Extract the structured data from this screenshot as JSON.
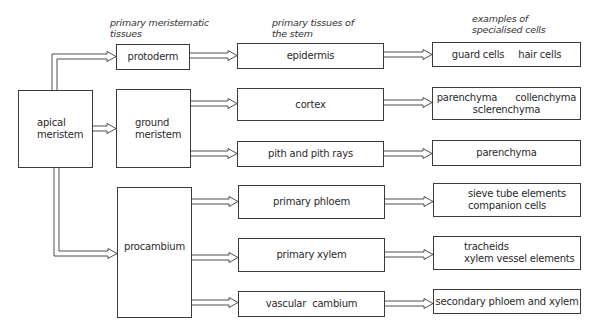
{
  "headers": {
    "meristematic": [
      "primary meristematic",
      "tissues"
    ],
    "primary_tissues": [
      "primary tissues of",
      "the stem"
    ],
    "specialised": [
      "examples of",
      "specialised cells"
    ]
  },
  "source": {
    "apical": [
      "apical",
      "meristem"
    ]
  },
  "meristems": {
    "protoderm": "protoderm",
    "ground": [
      "ground",
      "meristem"
    ],
    "procambium": "procambium"
  },
  "tissues": {
    "epidermis": "epidermis",
    "cortex": "cortex",
    "pith": "pith and pith rays",
    "primary_phloem": "primary phloem",
    "primary_xylem": "primary xylem",
    "vascular_cambium": "vascular  cambium"
  },
  "cells": {
    "epidermis": [
      "guard cells",
      "hair cells"
    ],
    "cortex": [
      "parenchyma",
      "collenchyma",
      "sclerenchyma"
    ],
    "pith": "parenchyma",
    "primary_phloem": [
      "sieve tube elements",
      "companion cells"
    ],
    "primary_xylem": [
      "tracheids",
      "xylem vessel elements"
    ],
    "vascular_cambium": "secondary phloem and xylem"
  },
  "colors": {
    "line": "#3a3a3a",
    "text": "#2a2a2a",
    "background": "#ffffff"
  }
}
